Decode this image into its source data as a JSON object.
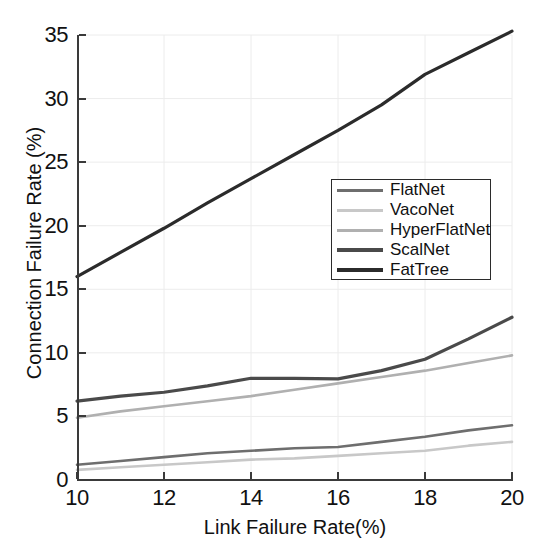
{
  "chart_data": {
    "type": "line",
    "title": "",
    "xlabel": "Link Failure Rate(%)",
    "ylabel": "Connection Failure Rate (%)",
    "xlim": [
      10,
      20
    ],
    "ylim": [
      0,
      35
    ],
    "xticks": [
      "10",
      "12",
      "14",
      "16",
      "18",
      "20"
    ],
    "yticks": [
      "0",
      "5",
      "10",
      "15",
      "20",
      "25",
      "30",
      "35"
    ],
    "grid": true,
    "legend_position": "center-right",
    "x": [
      10,
      11,
      12,
      13,
      14,
      15,
      16,
      17,
      18,
      19,
      20
    ],
    "series": [
      {
        "name": "FlatNet",
        "color": "#6e6e6e",
        "values": [
          1.2,
          1.5,
          1.8,
          2.1,
          2.3,
          2.5,
          2.6,
          3.0,
          3.4,
          3.9,
          4.3
        ]
      },
      {
        "name": "VacoNet",
        "color": "#c8c8c8",
        "values": [
          0.8,
          1.0,
          1.2,
          1.4,
          1.6,
          1.7,
          1.9,
          2.1,
          2.3,
          2.7,
          3.0
        ]
      },
      {
        "name": "HyperFlatNet",
        "color": "#b0b0b0",
        "values": [
          4.9,
          5.4,
          5.8,
          6.2,
          6.6,
          7.1,
          7.6,
          8.1,
          8.6,
          9.2,
          9.8
        ]
      },
      {
        "name": "ScalNet",
        "color": "#4a4a4a",
        "values": [
          6.2,
          6.6,
          6.9,
          7.4,
          8.0,
          8.0,
          7.95,
          8.6,
          9.5,
          11.1,
          12.8
        ]
      },
      {
        "name": "FatTree",
        "color": "#2b2b2b",
        "values": [
          16.0,
          17.9,
          19.8,
          21.8,
          23.7,
          25.6,
          27.5,
          29.5,
          31.9,
          33.6,
          35.3
        ]
      }
    ]
  },
  "axes": {
    "xlabel": "Link Failure Rate(%)",
    "ylabel": "Connection Failure Rate (%)"
  },
  "legend": {
    "items": [
      {
        "label": "FlatNet"
      },
      {
        "label": "VacoNet"
      },
      {
        "label": "HyperFlatNet"
      },
      {
        "label": "ScalNet"
      },
      {
        "label": "FatTree"
      }
    ]
  }
}
